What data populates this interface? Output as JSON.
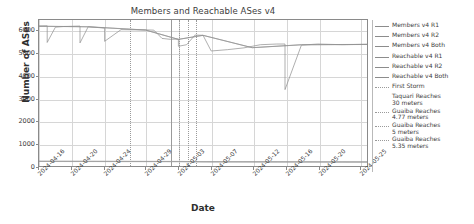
{
  "chart_data": {
    "type": "line",
    "title": "Members and Reachable ASes v4",
    "xlabel": "Date",
    "ylabel": "Number of ASes",
    "ylim": [
      0,
      6500
    ],
    "xlim": [
      "2024-04-16",
      "2024-05-26"
    ],
    "grid": true,
    "legend_position": "right-outside",
    "yticks": [
      0,
      1000,
      2000,
      3000,
      4000,
      5000,
      6000
    ],
    "ytick_labels": [
      "0",
      "1000",
      "2000",
      "3000",
      "4000",
      "5000",
      "6000"
    ],
    "xtick_labels": [
      "2024-04-16",
      "2024-04-20",
      "2024-04-24",
      "2024-04-29",
      "2024-05-03",
      "2024-05-07",
      "2024-05-12",
      "2024-05-16",
      "2024-05-20",
      "2024-05-25"
    ],
    "series": [
      {
        "name": "Members v4 R1",
        "color": "#8c8c8c",
        "style": "solid",
        "x": [
          "2024-04-16",
          "2024-04-17",
          "2024-04-17",
          "2024-04-18",
          "2024-04-19",
          "2024-04-21",
          "2024-04-21",
          "2024-04-22",
          "2024-04-24",
          "2024-04-24",
          "2024-04-26",
          "2024-04-28",
          "2024-04-29",
          "2024-04-30",
          "2024-05-01",
          "2024-05-02",
          "2024-05-03",
          "2024-05-03",
          "2024-05-04",
          "2024-05-05",
          "2024-05-05",
          "2024-05-06",
          "2024-05-07",
          "2024-05-09",
          "2024-05-11",
          "2024-05-13",
          "2024-05-15",
          "2024-05-16",
          "2024-05-16",
          "2024-05-18",
          "2024-05-20",
          "2024-05-23",
          "2024-05-26"
        ],
        "values": [
          6230,
          6240,
          5500,
          6180,
          6210,
          6230,
          5480,
          6200,
          6140,
          5550,
          6070,
          6060,
          6060,
          6050,
          5680,
          5640,
          5650,
          5330,
          5400,
          5820,
          5830,
          5820,
          5120,
          5180,
          5260,
          5400,
          5430,
          5430,
          3400,
          5380,
          5430,
          5400,
          5420
        ]
      },
      {
        "name": "Members v4 R2",
        "color": "#8f8f8f",
        "style": "solid",
        "x": [
          "2024-04-16",
          "2024-04-22",
          "2024-04-29",
          "2024-05-03",
          "2024-05-06",
          "2024-05-12",
          "2024-05-18",
          "2024-05-26"
        ],
        "values": [
          6225,
          6200,
          6055,
          5640,
          5820,
          5270,
          5400,
          5415
        ]
      },
      {
        "name": "Members v4 Both",
        "color": "#929292",
        "style": "solid",
        "x": [
          "2024-04-16",
          "2024-04-22",
          "2024-04-29",
          "2024-05-03",
          "2024-05-06",
          "2024-05-12",
          "2024-05-18",
          "2024-05-26"
        ],
        "values": [
          6220,
          6195,
          6050,
          5635,
          5815,
          5265,
          5395,
          5410
        ]
      },
      {
        "name": "Reachable v4 R1",
        "color": "#9a9a9a",
        "style": "solid",
        "x": [
          "2024-04-16",
          "2024-05-03",
          "2024-05-06",
          "2024-05-26"
        ],
        "values": [
          215,
          205,
          195,
          185
        ]
      },
      {
        "name": "Reachable v4 R2",
        "color": "#9d9d9d",
        "style": "solid",
        "x": [
          "2024-04-16",
          "2024-05-03",
          "2024-05-06",
          "2024-05-26"
        ],
        "values": [
          208,
          198,
          188,
          178
        ]
      },
      {
        "name": "Reachable v4 Both",
        "color": "#a0a0a0",
        "style": "solid",
        "x": [
          "2024-04-16",
          "2024-05-03",
          "2024-05-06",
          "2024-05-26"
        ],
        "values": [
          200,
          190,
          180,
          172
        ]
      }
    ],
    "event_lines": [
      {
        "name": "First Storm",
        "x": "2024-04-27",
        "style": "dotted"
      },
      {
        "name": "Taquari Reaches 30 meters",
        "x": "2024-05-02",
        "style": "solid"
      },
      {
        "name": "Guaiba Reaches 4.77 meters",
        "x": "2024-05-03",
        "style": "dotted"
      },
      {
        "name": "Guaiba Reaches 5 meters",
        "x": "2024-05-04",
        "style": "dotted"
      },
      {
        "name": "Guaiba Reaches 5.35 meters",
        "x": "2024-05-05",
        "style": "dotted"
      }
    ]
  },
  "legend": {
    "entries": [
      {
        "label": "Members v4 R1",
        "swatch": "solid"
      },
      {
        "label": "Members v4 R2",
        "swatch": "solid"
      },
      {
        "label": "Members v4 Both",
        "swatch": "solid"
      },
      {
        "label": "Reachable v4 R1",
        "swatch": "solid"
      },
      {
        "label": "Reachable v4 R2",
        "swatch": "solid"
      },
      {
        "label": "Reachable v4 Both",
        "swatch": "solid"
      },
      {
        "label": "First Storm",
        "swatch": "dotted"
      },
      {
        "label": "Taquari Reaches\n30 meters",
        "swatch": "blank"
      },
      {
        "label": "Guaiba Reaches\n4.77 meters",
        "swatch": "dotted"
      },
      {
        "label": "Guaiba Reaches\n5 meters",
        "swatch": "dotted"
      },
      {
        "label": "Guaiba Reaches\n5.35 meters",
        "swatch": "dotted"
      }
    ]
  }
}
